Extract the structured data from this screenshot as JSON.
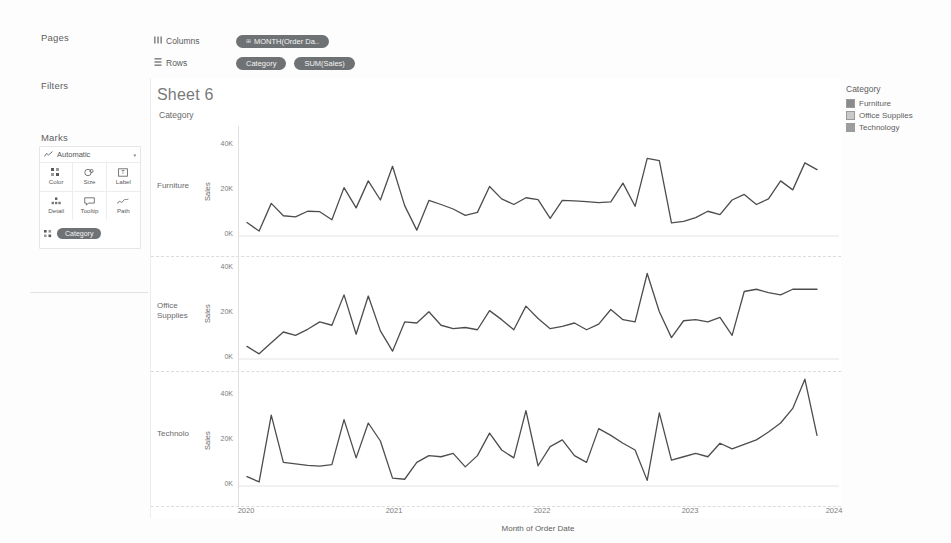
{
  "workbook": {
    "sheet_title": "Sheet 6"
  },
  "cards": {
    "pages": {
      "title": "Pages"
    },
    "filters": {
      "title": "Filters"
    },
    "marks": {
      "title": "Marks",
      "mark_type": "Automatic",
      "caret": "▾",
      "buttons": [
        {
          "label": "Color",
          "icon": "color-icon"
        },
        {
          "label": "Size",
          "icon": "size-icon"
        },
        {
          "label": "Label",
          "icon": "label-icon"
        },
        {
          "label": "Detail",
          "icon": "detail-icon"
        },
        {
          "label": "Tooltip",
          "icon": "tooltip-icon"
        },
        {
          "label": "Path",
          "icon": "path-icon"
        }
      ],
      "pill": {
        "label": "Category",
        "icon": "∷"
      }
    }
  },
  "shelves": {
    "columns": {
      "label": "Columns",
      "icon": "columns-icon",
      "pills": [
        {
          "label": "MONTH(Order Da..",
          "icon": "⊞",
          "kind": "date"
        }
      ]
    },
    "rows": {
      "label": "Rows",
      "icon": "rows-icon",
      "pills": [
        {
          "label": "Category",
          "icon": "",
          "kind": "dim"
        },
        {
          "label": "SUM(Sales)",
          "icon": "",
          "kind": "meas"
        }
      ]
    }
  },
  "view": {
    "row_field_label": "Category",
    "y_axis_title": "Sales",
    "y_ticks": [
      "40K",
      "20K",
      "0K"
    ],
    "x_axis_title": "Month of Order Date",
    "x_ticks": [
      "2020",
      "2021",
      "2022",
      "2023",
      "2024"
    ],
    "row_headers": [
      "Furniture",
      "Office Supplies",
      "Technolo"
    ]
  },
  "legend": {
    "title": "Category",
    "items": [
      {
        "label": "Furniture",
        "color": "#8a8a8a"
      },
      {
        "label": "Office Supplies",
        "color": "#c9c9c9"
      },
      {
        "label": "Technology",
        "color": "#9d9d9d"
      }
    ]
  },
  "chart_data": {
    "type": "line",
    "title": "Sheet 6",
    "xlabel": "Month of Order Date",
    "ylabel": "Sales",
    "ylim": [
      0,
      48000
    ],
    "ytick_values": [
      0,
      20000,
      40000
    ],
    "ytick_labels": [
      "0K",
      "20K",
      "40K"
    ],
    "xtick_labels": [
      "2020",
      "2021",
      "2022",
      "2023",
      "2024"
    ],
    "grid": false,
    "legend_position": "right",
    "small_multiples": "rows by Category",
    "x": [
      "2020-01",
      "2020-02",
      "2020-03",
      "2020-04",
      "2020-05",
      "2020-06",
      "2020-07",
      "2020-08",
      "2020-09",
      "2020-10",
      "2020-11",
      "2020-12",
      "2021-01",
      "2021-02",
      "2021-03",
      "2021-04",
      "2021-05",
      "2021-06",
      "2021-07",
      "2021-08",
      "2021-09",
      "2021-10",
      "2021-11",
      "2021-12",
      "2022-01",
      "2022-02",
      "2022-03",
      "2022-04",
      "2022-05",
      "2022-06",
      "2022-07",
      "2022-08",
      "2022-09",
      "2022-10",
      "2022-11",
      "2022-12",
      "2023-01",
      "2023-02",
      "2023-03",
      "2023-04",
      "2023-05",
      "2023-06",
      "2023-07",
      "2023-08",
      "2023-09",
      "2023-10",
      "2023-11",
      "2023-12"
    ],
    "series": [
      {
        "name": "Furniture",
        "color": "#4d4d4d",
        "values": [
          6000,
          2200,
          14500,
          9000,
          8500,
          11000,
          10800,
          7200,
          21500,
          12500,
          24500,
          16000,
          31000,
          13500,
          2600,
          15800,
          14000,
          12000,
          9200,
          10500,
          22000,
          16500,
          14000,
          17000,
          16200,
          7800,
          15800,
          15600,
          15300,
          14800,
          15200,
          23500,
          13200,
          34500,
          33500,
          5800,
          6500,
          8200,
          11000,
          9500,
          16000,
          18500,
          14000,
          16500,
          24500,
          20500,
          32500,
          29500
        ]
      },
      {
        "name": "Office Supplies",
        "color": "#4d4d4d",
        "values": [
          5600,
          2300,
          7200,
          12000,
          10500,
          13200,
          16500,
          15000,
          28500,
          11000,
          28000,
          12500,
          3500,
          16500,
          16000,
          21000,
          15000,
          13500,
          14000,
          13000,
          21500,
          17500,
          13000,
          23500,
          18000,
          13500,
          14500,
          16000,
          13000,
          15500,
          22000,
          17500,
          16500,
          38000,
          21000,
          9500,
          17000,
          17500,
          16500,
          18500,
          10500,
          30000,
          31000,
          29500,
          28500,
          31000,
          31000,
          31000
        ]
      },
      {
        "name": "Technology",
        "color": "#4d4d4d",
        "values": [
          4200,
          1800,
          31500,
          10500,
          9800,
          9200,
          8800,
          9500,
          29500,
          12500,
          28000,
          20000,
          3500,
          3000,
          10500,
          13500,
          13000,
          14500,
          8500,
          13500,
          23500,
          16000,
          12500,
          33500,
          9000,
          17500,
          20500,
          13500,
          10500,
          25500,
          22500,
          19000,
          16000,
          2500,
          32500,
          11500,
          13000,
          14500,
          13000,
          19000,
          16500,
          18500,
          20500,
          24000,
          28000,
          34500,
          47500,
          22500
        ]
      }
    ]
  }
}
